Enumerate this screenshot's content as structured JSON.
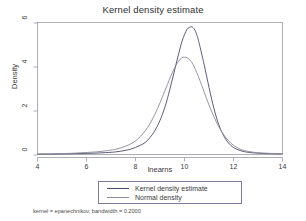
{
  "chart_data": {
    "type": "line",
    "title": "Kernel density estimate",
    "xlabel": "lnearns",
    "ylabel": "Density",
    "xlim": [
      4,
      14
    ],
    "ylim": [
      0,
      6
    ],
    "xticks": [
      "4",
      "6",
      "8",
      "10",
      "12",
      "14"
    ],
    "yticks": [
      "0",
      "2",
      "4",
      "6"
    ],
    "grid": false,
    "legend_position": "below-plot",
    "note": "kernel = epanechnikov, bandwidth = 0.2000",
    "series": [
      {
        "name": "Kernel density estimate",
        "color": "#4a4a6a",
        "x": [
          4.0,
          4.5,
          5.0,
          5.5,
          6.0,
          6.5,
          7.0,
          7.2,
          7.4,
          7.6,
          7.8,
          8.0,
          8.2,
          8.4,
          8.6,
          8.8,
          9.0,
          9.2,
          9.4,
          9.6,
          9.8,
          9.9,
          10.0,
          10.1,
          10.2,
          10.3,
          10.4,
          10.5,
          10.6,
          10.8,
          11.0,
          11.2,
          11.4,
          11.6,
          11.8,
          12.0,
          12.3,
          12.6,
          13.0,
          13.5,
          14.0
        ],
        "y": [
          0.02,
          0.02,
          0.03,
          0.04,
          0.05,
          0.07,
          0.1,
          0.12,
          0.15,
          0.19,
          0.24,
          0.32,
          0.42,
          0.55,
          0.78,
          1.1,
          1.55,
          2.15,
          2.95,
          3.85,
          4.75,
          5.15,
          5.45,
          5.68,
          5.78,
          5.8,
          5.7,
          5.45,
          5.05,
          4.1,
          3.05,
          2.1,
          1.35,
          0.85,
          0.52,
          0.32,
          0.17,
          0.1,
          0.06,
          0.04,
          0.03
        ]
      },
      {
        "name": "Normal density",
        "color": "#8a8a99",
        "x": [
          4.0,
          4.5,
          5.0,
          5.5,
          6.0,
          6.5,
          7.0,
          7.2,
          7.4,
          7.6,
          7.8,
          8.0,
          8.2,
          8.4,
          8.6,
          8.8,
          9.0,
          9.2,
          9.4,
          9.6,
          9.8,
          9.9,
          10.0,
          10.1,
          10.2,
          10.3,
          10.4,
          10.5,
          10.6,
          10.8,
          11.0,
          11.2,
          11.4,
          11.6,
          11.8,
          12.0,
          12.3,
          12.6,
          13.0,
          13.5,
          14.0
        ],
        "y": [
          0.02,
          0.03,
          0.04,
          0.06,
          0.09,
          0.13,
          0.2,
          0.24,
          0.3,
          0.38,
          0.48,
          0.62,
          0.82,
          1.08,
          1.42,
          1.85,
          2.35,
          2.9,
          3.45,
          3.95,
          4.3,
          4.4,
          4.42,
          4.4,
          4.32,
          4.18,
          3.98,
          3.72,
          3.45,
          2.85,
          2.25,
          1.72,
          1.26,
          0.9,
          0.62,
          0.42,
          0.23,
          0.14,
          0.08,
          0.05,
          0.04
        ]
      }
    ]
  },
  "axes": {
    "frame_color": "#9a9aa8"
  }
}
